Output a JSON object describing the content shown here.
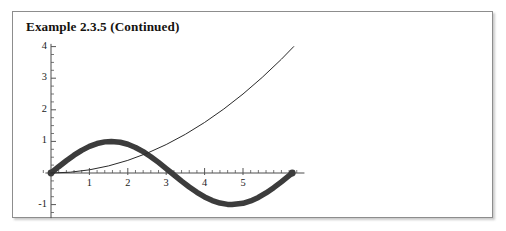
{
  "figure": {
    "title": "Example 2.3.5 (Continued)",
    "background": "#ffffff",
    "frame_color": "#8d8d8d"
  },
  "chart_data": {
    "type": "line",
    "title": "Example 2.3.5 (Continued)",
    "xlabel": "",
    "ylabel": "",
    "xlim": [
      -0.25,
      6.6
    ],
    "ylim": [
      -1.3,
      4.15
    ],
    "grid": false,
    "legend": null,
    "axis_style": {
      "x_axis_at_y": 0,
      "y_axis_at_x": 0,
      "x_major_ticks": [
        1,
        2,
        3,
        4,
        5
      ],
      "x_major_tick_labels": [
        "1",
        "2",
        "3",
        "4",
        "5"
      ],
      "x_minor_tick_step": 0.2,
      "y_major_ticks": [
        -1,
        1,
        2,
        3,
        4
      ],
      "y_major_tick_labels": [
        "-1",
        "1",
        "2",
        "3",
        "4"
      ],
      "y_minor_tick_step": 0.25,
      "tick_color": "#555555",
      "axis_color": "#4d4d4d"
    },
    "series": [
      {
        "name": "sin(x)",
        "style": "thick",
        "color": "#3c3c3c",
        "linewidth_px": 5.5,
        "endpoint_marker": "dot at (6.28, 0)",
        "x": [
          0,
          0.2,
          0.4,
          0.6,
          0.8,
          1,
          1.2,
          1.4,
          1.5708,
          1.8,
          2,
          2.2,
          2.4,
          2.6,
          2.8,
          3,
          3.1416,
          3.4,
          3.6,
          3.8,
          4,
          4.2,
          4.4,
          4.6,
          4.7124,
          5,
          5.2,
          5.4,
          5.6,
          5.8,
          6,
          6.2,
          6.2832
        ],
        "y": [
          0,
          0.199,
          0.389,
          0.565,
          0.717,
          0.841,
          0.932,
          0.985,
          1,
          0.974,
          0.909,
          0.808,
          0.675,
          0.516,
          0.335,
          0.141,
          0,
          -0.256,
          -0.443,
          -0.612,
          -0.757,
          -0.872,
          -0.952,
          -0.994,
          -1,
          -0.959,
          -0.883,
          -0.773,
          -0.631,
          -0.465,
          -0.279,
          -0.083,
          0
        ]
      },
      {
        "name": "x^2/10",
        "style": "thin",
        "color": "#2a2a2a",
        "linewidth_px": 1,
        "x": [
          0,
          0.5,
          1,
          1.5,
          2,
          2.5,
          3,
          3.5,
          4,
          4.5,
          5,
          5.5,
          6,
          6.32
        ],
        "y": [
          0,
          0.025,
          0.1,
          0.225,
          0.4,
          0.625,
          0.9,
          1.225,
          1.6,
          2.025,
          2.5,
          3.025,
          3.6,
          4.0
        ]
      }
    ],
    "intersections": [
      {
        "x": 0,
        "y": 0
      },
      {
        "x": 2.52,
        "y": 0.635
      }
    ]
  },
  "axis_labels": {
    "y": [
      {
        "text": "4",
        "value": 4
      },
      {
        "text": "3",
        "value": 3
      },
      {
        "text": "2",
        "value": 2
      },
      {
        "text": "1",
        "value": 1
      },
      {
        "text": "-1",
        "value": -1
      }
    ],
    "x": [
      {
        "text": "1",
        "value": 1
      },
      {
        "text": "2",
        "value": 2
      },
      {
        "text": "3",
        "value": 3
      },
      {
        "text": "4",
        "value": 4
      },
      {
        "text": "5",
        "value": 5
      }
    ]
  }
}
